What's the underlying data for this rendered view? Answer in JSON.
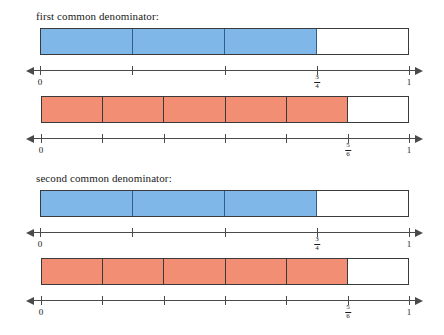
{
  "figure": {
    "type": "fraction-bar-diagram",
    "background": "#ffffff",
    "blue_fill": "#7FB7E8",
    "red_fill": "#F28E74",
    "line_color": "#4a4a4a",
    "border_color": "#3a3a3a"
  },
  "sections": [
    {
      "heading": "first common denominator:",
      "rows": [
        {
          "color": "blue",
          "denominator": 4,
          "shaded": 3,
          "fraction": {
            "numerator": "3",
            "denominator": "4"
          },
          "axis": {
            "start_label": "0",
            "end_label": "1",
            "ticks": [
              0,
              1,
              2,
              3,
              4
            ],
            "marked_tick": 3
          }
        },
        {
          "color": "red",
          "denominator": 6,
          "shaded": 5,
          "fraction": {
            "numerator": "5",
            "denominator": "6"
          },
          "axis": {
            "start_label": "0",
            "end_label": "1",
            "ticks": [
              0,
              1,
              2,
              3,
              4,
              5,
              6
            ],
            "marked_tick": 5
          }
        }
      ]
    },
    {
      "heading": "second common denominator:",
      "rows": [
        {
          "color": "blue",
          "denominator": 4,
          "shaded": 3,
          "fraction": {
            "numerator": "3",
            "denominator": "4"
          },
          "axis": {
            "start_label": "0",
            "end_label": "1",
            "ticks": [
              0,
              1,
              2,
              3,
              4
            ],
            "marked_tick": 3
          }
        },
        {
          "color": "red",
          "denominator": 6,
          "shaded": 5,
          "fraction": {
            "numerator": "5",
            "denominator": "6"
          },
          "axis": {
            "start_label": "0",
            "end_label": "1",
            "ticks": [
              0,
              1,
              2,
              3,
              4,
              5,
              6
            ],
            "marked_tick": 5
          }
        }
      ]
    }
  ],
  "geometry": {
    "bar_left": 40,
    "bar_right": 409,
    "axis_left": 33,
    "axis_right": 416,
    "section_tops": [
      10,
      172
    ],
    "row_offsets": [
      18,
      86
    ],
    "bar_height": 27,
    "axis_offset": 36
  }
}
